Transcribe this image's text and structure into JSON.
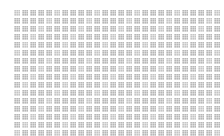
{
  "canvas": {
    "width": 224,
    "height": 136,
    "background": "#ffffff"
  },
  "grid": {
    "columns": 26,
    "rows": 16,
    "cell_size_px": 6,
    "gap_px": 2,
    "origin": {
      "x": 14,
      "y": 10
    },
    "tile_color": "#b8b8b8",
    "pattern": "halftone-dither"
  }
}
